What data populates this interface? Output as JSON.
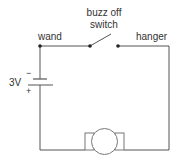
{
  "diagram": {
    "type": "circuit",
    "labels": {
      "wand": "wand",
      "switch_line1": "buzz off",
      "switch_line2": "switch",
      "hanger": "hanger",
      "battery_voltage": "3V",
      "battery_negative": "−",
      "battery_positive": "+",
      "buzzer": "buzzer"
    },
    "components": [
      "battery",
      "switch",
      "buzzer"
    ],
    "colors": {
      "wire": "#555555",
      "text": "#333333"
    }
  }
}
